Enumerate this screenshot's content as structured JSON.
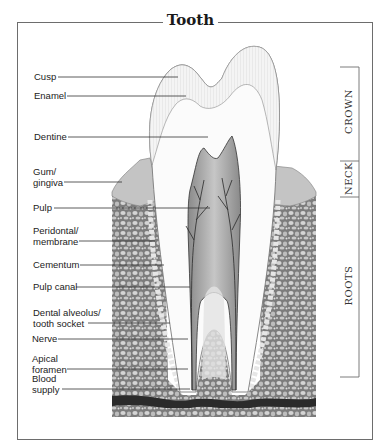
{
  "title": "Tooth",
  "labels": [
    {
      "id": "cusp",
      "text": "Cusp"
    },
    {
      "id": "enamel",
      "text": "Enamel"
    },
    {
      "id": "dentine",
      "text": "Dentine"
    },
    {
      "id": "gum",
      "line1": "Gum/",
      "line2": "gingiva"
    },
    {
      "id": "pulp",
      "text": "Pulp"
    },
    {
      "id": "periodontal",
      "line1": "Peridontal/",
      "line2": "membrane"
    },
    {
      "id": "cementum",
      "text": "Cementum"
    },
    {
      "id": "pulp_canal",
      "text": "Pulp canal"
    },
    {
      "id": "alveolus",
      "line1": "Dental alveolus/",
      "line2": "tooth socket"
    },
    {
      "id": "nerve",
      "text": "Nerve"
    },
    {
      "id": "apical",
      "line1": "Apical",
      "line2": "foramen"
    },
    {
      "id": "blood",
      "line1": "Blood",
      "line2": "supply"
    }
  ],
  "regions": [
    {
      "id": "crown",
      "text": "CROWN"
    },
    {
      "id": "neck",
      "text": "NECK"
    },
    {
      "id": "roots",
      "text": "ROOTS"
    }
  ],
  "colors": {
    "frame": "#6d6d6d",
    "bone": "#8f8f8f",
    "bone_cell": "#cfcfcf",
    "enamel": "#f2f2f2",
    "dentine": "#ffffff",
    "pulp": "#b0b0b0",
    "gum": "#c8c8c8"
  }
}
